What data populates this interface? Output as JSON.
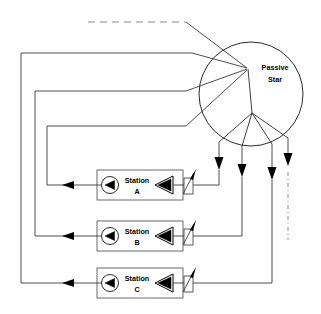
{
  "diagram": {
    "canvas": {
      "width": 321,
      "height": 314,
      "background": "#ffffff"
    },
    "line_color": "#3a3a3a",
    "ink_color": "#000000",
    "hub": {
      "label_line1": "Passive",
      "label_line2": "Star",
      "center": {
        "x": 251,
        "y": 94
      },
      "radius": 52,
      "upper_hub": {
        "x": 248,
        "y": 69
      },
      "lower_hub": {
        "x": 252,
        "y": 113
      }
    },
    "stations": [
      {
        "id": "station-a",
        "label_line1": "Station",
        "label_line2": "A",
        "box": {
          "x": 97,
          "y": 170,
          "width": 86,
          "height": 30
        },
        "receiver_icon": "receiver-circle-icon",
        "transmitter_icon": "transmitter-triangle-icon",
        "laser_icon": "laser-source-icon",
        "uplink_x": 219,
        "downlink_return_x": 47
      },
      {
        "id": "station-b",
        "label_line1": "Station",
        "label_line2": "B",
        "box": {
          "x": 97,
          "y": 221,
          "width": 86,
          "height": 30
        },
        "receiver_icon": "receiver-circle-icon",
        "transmitter_icon": "transmitter-triangle-icon",
        "laser_icon": "laser-source-icon",
        "uplink_x": 242,
        "downlink_return_x": 35
      },
      {
        "id": "station-c",
        "label_line1": "Station",
        "label_line2": "C",
        "box": {
          "x": 97,
          "y": 268,
          "width": 86,
          "height": 30
        },
        "receiver_icon": "receiver-circle-icon",
        "transmitter_icon": "transmitter-triangle-icon",
        "laser_icon": "laser-source-icon",
        "uplink_x": 272,
        "downlink_return_x": 21
      }
    ],
    "continuation": {
      "top_dashed_note": "dashed-continuation-top",
      "right_dashdot_note": "dashdot-continuation-right",
      "extra_downlink_x": 288
    }
  }
}
